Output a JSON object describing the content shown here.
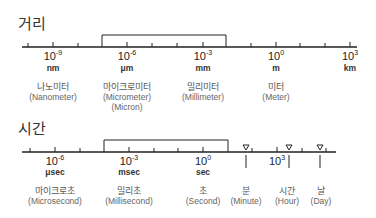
{
  "distance": {
    "title": "거리",
    "ticks": [
      {
        "x": 53,
        "base": "10",
        "exp": "-9",
        "unit": "nm",
        "ko": "나노미터",
        "en": "(Nanometer)"
      },
      {
        "x": 127,
        "base": "10",
        "exp": "-6",
        "unit": "μm",
        "ko": "마이크로미터",
        "en": "(Micrometer)",
        "en2": "(Micron)"
      },
      {
        "x": 203,
        "base": "10",
        "exp": "-3",
        "unit": "mm",
        "ko": "밀리미터",
        "en": "(Millimeter)"
      },
      {
        "x": 276,
        "base": "10",
        "exp": "0",
        "unit": "m",
        "ko": "미터",
        "en": "(Meter)"
      },
      {
        "x": 350,
        "base": "10",
        "exp": "3",
        "unit": "km"
      }
    ]
  },
  "time": {
    "title": "시간",
    "ticks": [
      {
        "x": 55,
        "base": "10",
        "exp": "-6",
        "unit": "μsec",
        "ko": "마이크로초",
        "en": "(Microsecond)"
      },
      {
        "x": 129,
        "base": "10",
        "exp": "-3",
        "unit": "msec",
        "ko": "밀리초",
        "en": "(Millisecond)"
      },
      {
        "x": 203,
        "base": "10",
        "exp": "0",
        "unit": "sec",
        "ko": "초",
        "en": "(Second)"
      },
      {
        "x": 277,
        "base": "10",
        "exp": "3"
      }
    ],
    "markers": [
      {
        "x": 246,
        "ko": "분",
        "en": "(Minute)"
      },
      {
        "x": 289,
        "ko": "시간",
        "en": "(Hour)"
      },
      {
        "x": 320,
        "ko": "날",
        "en": "(Day)"
      }
    ]
  }
}
